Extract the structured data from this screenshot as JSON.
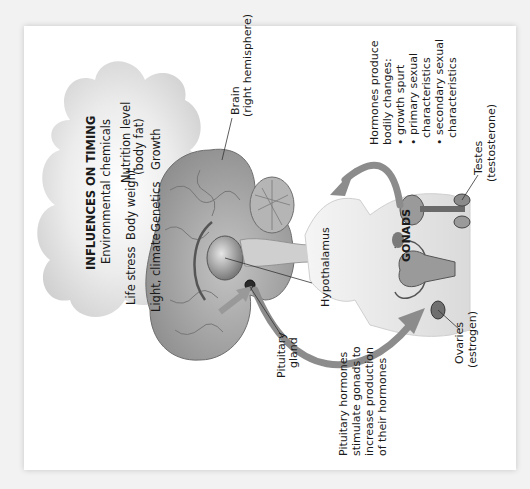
{
  "figure": {
    "orientation": "rotated 90 degrees counterclockwise",
    "cloud": {
      "title": "INFLUENCES ON TIMING",
      "items": [
        "Environmental chemicals",
        "Life stress",
        "Body weight",
        "Nutrition level",
        "(body fat)",
        "Light, climate",
        "Genetics",
        "Growth"
      ]
    },
    "labels": {
      "brain_line1": "Brain",
      "brain_line2": "(right hemisphere)",
      "hypothalamus": "Hypothalamus",
      "pituitary_line1": "Pituitary",
      "pituitary_line2": "gland",
      "pituitary_note": [
        "Pituitary hormones",
        "stimulate gonads to",
        "increase production",
        "of their hormones"
      ],
      "gonads": "GONADS",
      "testes_line1": "Testes",
      "testes_line2": "(testosterone)",
      "ovaries_line1": "Ovaries",
      "ovaries_line2": "(estrogen)",
      "bodily_changes": {
        "line1": "Hormones produce",
        "line2": "bodily changes:",
        "bullets": [
          "growth spurt",
          "primary sexual",
          "characteristics",
          "secondary sexual",
          "characteristics"
        ]
      }
    },
    "colors": {
      "cloud": "#d9d9d9",
      "brain": "#a8a8a8",
      "arrow": "#8c8c8c",
      "body": "#e6e6e6",
      "text": "#1a1a1a"
    }
  }
}
